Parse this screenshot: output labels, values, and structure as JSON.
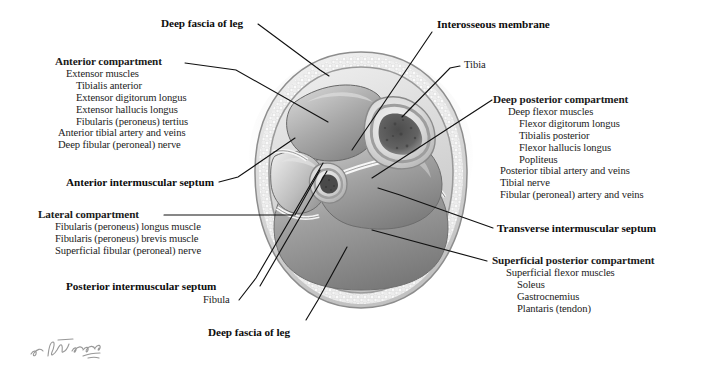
{
  "figure": {
    "type": "anatomical-cross-section",
    "artist_signature": "F. Netter"
  },
  "labels": {
    "deep_fascia_top": "Deep fascia of leg",
    "interosseous_membrane": "Interosseous membrane",
    "tibia": "Tibia",
    "fibula": "Fibula",
    "deep_fascia_bottom": "Deep fascia of leg",
    "anterior_intermuscular_septum": "Anterior intermuscular septum",
    "posterior_intermuscular_septum": "Posterior intermuscular septum",
    "transverse_intermuscular_septum": "Transverse intermuscular septum"
  },
  "compartments": {
    "anterior": {
      "title": "Anterior compartment",
      "items": [
        "Extensor muscles",
        "Tibialis anterior",
        "Extensor digitorum longus",
        "Extensor hallucis longus",
        "Fibularis (peroneus) tertius",
        "Anterior tibial artery and veins",
        "Deep fibular (peroneal) nerve"
      ]
    },
    "lateral": {
      "title": "Lateral compartment",
      "items": [
        "Fibularis (peroneus) longus muscle",
        "Fibularis (peroneus) brevis muscle",
        "Superficial fibular (peroneal) nerve"
      ]
    },
    "deep_posterior": {
      "title": "Deep posterior compartment",
      "items": [
        "Deep flexor muscles",
        "Flexor digitorum longus",
        "Tibialis posterior",
        "Flexor hallucis longus",
        "Popliteus",
        "Posterior tibial artery and veins",
        "Tibial nerve",
        "Fibular (peroneal) artery and veins"
      ]
    },
    "superficial_posterior": {
      "title": "Superficial posterior compartment",
      "items": [
        "Superficial flexor muscles",
        "Soleus",
        "Gastrocnemius",
        "Plantaris (tendon)"
      ]
    }
  },
  "colors": {
    "background": "#ffffff",
    "text": "#111111",
    "leader_line": "#111111",
    "illustration_mid": "#b9b9b9",
    "illustration_dark": "#6e6e6e",
    "illustration_light": "#e9e9e9"
  }
}
